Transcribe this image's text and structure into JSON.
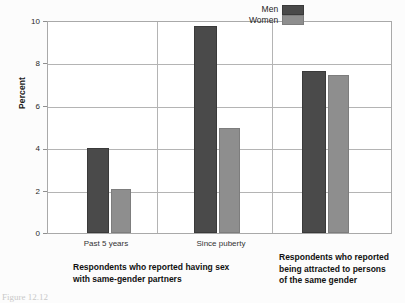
{
  "chart_data": {
    "type": "bar",
    "title": "",
    "xlabel": "",
    "ylabel": "Percent",
    "ylim": [
      0,
      10
    ],
    "yticks": [
      0,
      2,
      4,
      6,
      8,
      10
    ],
    "ytick_labels": [
      "0",
      "2",
      "4",
      "6",
      "8",
      "10"
    ],
    "grid": true,
    "legend_position": "top-right",
    "categories": [
      "Past 5 years",
      "Since puberty",
      ""
    ],
    "series": [
      {
        "name": "Men",
        "color": "#4a4a4a",
        "values": [
          4.05,
          9.8,
          7.7
        ]
      },
      {
        "name": "Women",
        "color": "#8e8e8e",
        "values": [
          2.1,
          5.0,
          7.5
        ]
      }
    ],
    "group_captions": [
      "Respondents who reported having sex with same-gender partners",
      "Respondents who reported being attracted to persons of the same gender"
    ]
  },
  "axis": {
    "y_title": "Percent",
    "y_ticks": [
      {
        "label": "10",
        "value": 10
      },
      {
        "label": "8",
        "value": 8
      },
      {
        "label": "6",
        "value": 6
      },
      {
        "label": "4",
        "value": 4
      },
      {
        "label": "2",
        "value": 2
      },
      {
        "label": "0",
        "value": 0
      }
    ],
    "x_ticks": [
      {
        "label": "Past 5 years"
      },
      {
        "label": "Since puberty"
      }
    ]
  },
  "legend": {
    "items": [
      {
        "label": "Men",
        "color": "#4a4a4a"
      },
      {
        "label": "Women",
        "color": "#8e8e8e"
      }
    ]
  },
  "captions": {
    "left": {
      "line1": "Respondents who reported having sex",
      "line2": "with same-gender partners"
    },
    "right": {
      "line1": "Respondents who reported",
      "line2": "being attracted to persons",
      "line3": "of the same gender"
    }
  },
  "figure_caption": "Figure 12.12"
}
